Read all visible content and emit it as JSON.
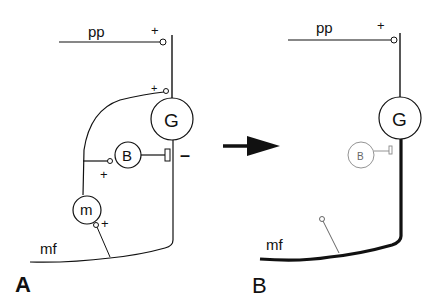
{
  "diagram": {
    "panel_a": {
      "label": "A",
      "inputs": {
        "pp": "pp",
        "mf": "mf"
      },
      "cells": {
        "granule": "G",
        "basket": "B",
        "mossy": "m"
      },
      "signs": {
        "pp_synapse": "+",
        "mossy_to_granule": "+",
        "mossy_to_basket": "+",
        "mf_to_mossy": "+",
        "basket_to_granule": "–"
      }
    },
    "panel_b": {
      "label": "B",
      "inputs": {
        "pp": "pp",
        "mf": "mf"
      },
      "cells": {
        "granule": "G",
        "basket": "B"
      },
      "signs": {
        "pp_synapse": "+"
      }
    },
    "arrow": "transition-arrow",
    "colors": {
      "ink": "#111111",
      "faded": "#888888"
    }
  }
}
